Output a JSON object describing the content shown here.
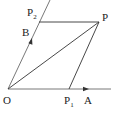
{
  "diagram": {
    "title": "",
    "points": {
      "O": {
        "label": "O",
        "sub": "",
        "x": 8,
        "y": 89
      },
      "P": {
        "label": "P",
        "sub": "",
        "x": 99,
        "y": 22
      },
      "P1": {
        "label": "P",
        "sub": "1",
        "x": 69,
        "y": 89
      },
      "P2": {
        "label": "P",
        "sub": "2",
        "x": 39,
        "y": 22
      },
      "A": {
        "label": "A",
        "sub": "",
        "x": 87,
        "y": 89
      },
      "B": {
        "label": "B",
        "sub": "",
        "x": 31,
        "y": 38
      }
    },
    "segments": [
      [
        "O",
        "P1"
      ],
      [
        "P1",
        "P"
      ],
      [
        "P",
        "P2"
      ],
      [
        "P2",
        "O"
      ],
      [
        "O",
        "P"
      ]
    ],
    "rays": [
      {
        "from": "O",
        "through": "A",
        "arrow_at": "A"
      },
      {
        "from": "O",
        "through": "B",
        "arrow_at": "B"
      }
    ],
    "colors": {
      "line": "#333333",
      "text": "#222222",
      "background": "#ffffff"
    }
  }
}
